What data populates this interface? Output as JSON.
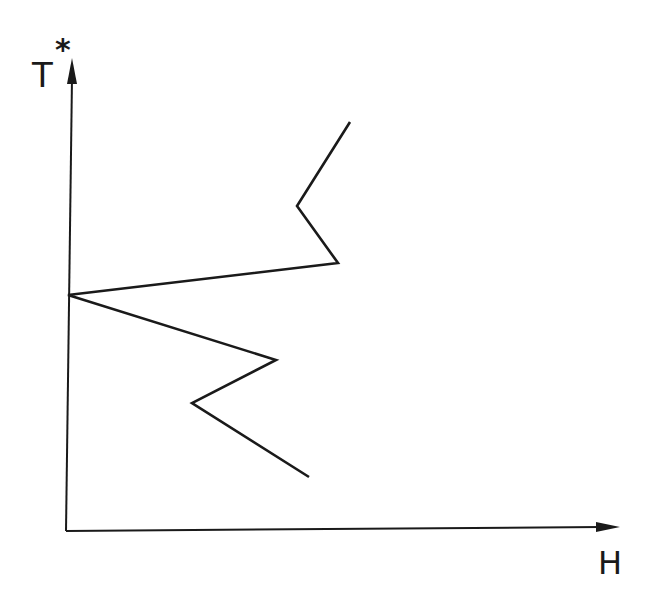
{
  "diagram": {
    "y_axis_label": "T",
    "y_axis_superscript": "*",
    "x_axis_label": "H",
    "line_color": "#1a1a1a",
    "axes": {
      "origin": [
        66,
        531
      ],
      "y_end": [
        72,
        58
      ],
      "x_end": [
        620,
        527
      ]
    },
    "polyline": [
      [
        350,
        122
      ],
      [
        297,
        206
      ],
      [
        338,
        263
      ],
      [
        68,
        295
      ],
      [
        276,
        360
      ],
      [
        192,
        403
      ],
      [
        309,
        477
      ]
    ]
  }
}
